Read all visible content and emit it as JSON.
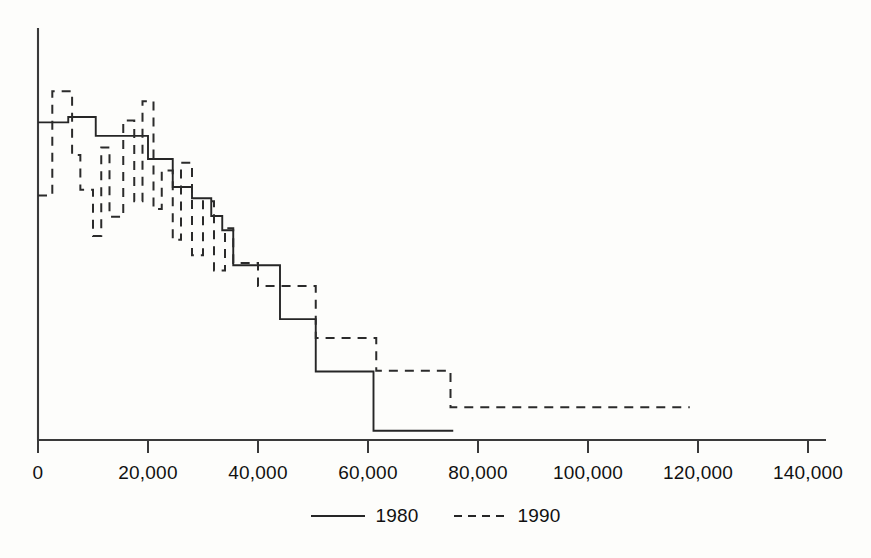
{
  "chart_data": {
    "type": "line",
    "title": "",
    "subtitle": "",
    "xlabel": "",
    "ylabel": "",
    "xlim": [
      0,
      145000
    ],
    "ylim": [
      0,
      100
    ],
    "grid": false,
    "legend_position": "bottom-center",
    "style": "step-function",
    "xticks": [
      0,
      20000,
      40000,
      60000,
      80000,
      100000,
      120000,
      140000
    ],
    "xtick_labels": [
      "0",
      "20,000",
      "40,000",
      "60,000",
      "80,000",
      "100,000",
      "120,000",
      "140,000"
    ],
    "yticks": [],
    "ytick_labels": [],
    "series": [
      {
        "name": "1980",
        "line_style": "solid",
        "color": "#262626",
        "x": [
          0,
          5500,
          10500,
          15500,
          20000,
          21000,
          24500,
          25500,
          28000,
          30500,
          31500,
          33500,
          35000,
          35500,
          40000,
          44000,
          50000,
          50500,
          60500,
          61000,
          75500
        ],
        "y": [
          82.5,
          83.9,
          79.0,
          79.0,
          73.0,
          73.0,
          65.7,
          65.7,
          62.8,
          62.8,
          58.2,
          54.5,
          54.5,
          45.4,
          45.4,
          31.4,
          31.4,
          17.8,
          17.8,
          2.4,
          2.4
        ]
      },
      {
        "name": "1990",
        "line_style": "dashed",
        "color": "#2b2b2b",
        "x": [
          0,
          2600,
          6200,
          7700,
          10000,
          11500,
          13000,
          15500,
          17500,
          19000,
          21000,
          22500,
          24500,
          26000,
          28000,
          30000,
          32000,
          34000,
          35500,
          40000,
          44500,
          50500,
          60500,
          61500,
          75000,
          118500
        ],
        "y": [
          63.5,
          90.6,
          74.0,
          65.0,
          53.0,
          76.0,
          58.0,
          83.0,
          62.0,
          88.0,
          60.0,
          70.0,
          52.0,
          72.0,
          48.0,
          62.0,
          44.0,
          55.0,
          46.0,
          40.0,
          40.0,
          26.5,
          26.5,
          18.0,
          8.5,
          8.5
        ]
      }
    ],
    "annotations": []
  },
  "legend": {
    "entries": [
      {
        "label": "1980",
        "style": "solid"
      },
      {
        "label": "1990",
        "style": "dashed"
      }
    ]
  },
  "axes": {
    "x_axis_name": "x-axis",
    "y_axis_name": "y-axis"
  }
}
